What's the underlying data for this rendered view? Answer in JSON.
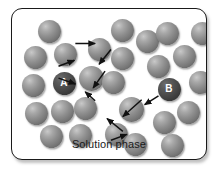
{
  "figure": {
    "caption": "Solution phase",
    "frame": {
      "border_color": "#1a1a1a",
      "background_color": "#ffffff",
      "corner_radius_px": 11
    },
    "particles": {
      "fill_color": "#8e8e8e",
      "highlight_color": "#c9c9c9",
      "labeled_fill_color": "#3a3a3a",
      "label_text_color": "#ffffff",
      "count": 28,
      "items": [
        {
          "id": "p1",
          "cx": 37,
          "cy": 22,
          "r": 11.5,
          "label": ""
        },
        {
          "id": "p2",
          "cx": 23,
          "cy": 48,
          "r": 11.5,
          "label": ""
        },
        {
          "id": "p3",
          "cx": 53,
          "cy": 45,
          "r": 11.5,
          "label": ""
        },
        {
          "id": "p4",
          "cx": 21,
          "cy": 76,
          "r": 11.5,
          "label": ""
        },
        {
          "id": "p5",
          "cx": 52,
          "cy": 74,
          "r": 11.5,
          "label": "A"
        },
        {
          "id": "p6",
          "cx": 24,
          "cy": 104,
          "r": 11.5,
          "label": ""
        },
        {
          "id": "p7",
          "cx": 50,
          "cy": 102,
          "r": 11.5,
          "label": ""
        },
        {
          "id": "p8",
          "cx": 39,
          "cy": 127,
          "r": 11.5,
          "label": ""
        },
        {
          "id": "p9",
          "cx": 68,
          "cy": 126,
          "r": 11.5,
          "label": ""
        },
        {
          "id": "p10",
          "cx": 73,
          "cy": 99,
          "r": 11.5,
          "label": ""
        },
        {
          "id": "p11",
          "cx": 79,
          "cy": 69,
          "r": 12.5,
          "label": ""
        },
        {
          "id": "p12",
          "cx": 87,
          "cy": 40,
          "r": 11.5,
          "label": ""
        },
        {
          "id": "p13",
          "cx": 104,
          "cy": 125,
          "r": 11.5,
          "label": ""
        },
        {
          "id": "p14",
          "cx": 101,
          "cy": 73,
          "r": 11.5,
          "label": ""
        },
        {
          "id": "p15",
          "cx": 110,
          "cy": 49,
          "r": 11.5,
          "label": ""
        },
        {
          "id": "p16",
          "cx": 123,
          "cy": 135,
          "r": 11.5,
          "label": ""
        },
        {
          "id": "p17",
          "cx": 119,
          "cy": 100,
          "r": 12.5,
          "label": ""
        },
        {
          "id": "p18",
          "cx": 135,
          "cy": 32,
          "r": 11.5,
          "label": ""
        },
        {
          "id": "p19",
          "cx": 146,
          "cy": 57,
          "r": 11.5,
          "label": ""
        },
        {
          "id": "p20",
          "cx": 152,
          "cy": 113,
          "r": 11.5,
          "label": ""
        },
        {
          "id": "p21",
          "cx": 160,
          "cy": 136,
          "r": 11.5,
          "label": ""
        },
        {
          "id": "p22",
          "cx": 157,
          "cy": 80,
          "r": 11.5,
          "label": "B"
        },
        {
          "id": "p23",
          "cx": 176,
          "cy": 103,
          "r": 11.5,
          "label": ""
        },
        {
          "id": "p24",
          "cx": 172,
          "cy": 47,
          "r": 11.5,
          "label": ""
        },
        {
          "id": "p25",
          "cx": 155,
          "cy": 24,
          "r": 11.5,
          "label": ""
        },
        {
          "id": "p26",
          "cx": 188,
          "cy": 73,
          "r": 11.5,
          "label": ""
        },
        {
          "id": "p27",
          "cx": 190,
          "cy": 24,
          "r": 11.5,
          "label": ""
        },
        {
          "id": "p28",
          "cx": 110,
          "cy": 21,
          "r": 11.5,
          "label": ""
        }
      ]
    },
    "arrows": {
      "color": "#111111",
      "description": "Diffusion hop path from particle A to particle B",
      "segments": [
        {
          "id": "a1",
          "x1": 47,
          "y1": 58,
          "x2": 63,
          "y2": 52
        },
        {
          "id": "a2",
          "x1": 47,
          "y1": 70,
          "x2": 64,
          "y2": 76
        },
        {
          "id": "a3",
          "x1": 64,
          "y1": 35,
          "x2": 84,
          "y2": 35
        },
        {
          "id": "a4",
          "x1": 100,
          "y1": 41,
          "x2": 88,
          "y2": 56
        },
        {
          "id": "a5",
          "x1": 94,
          "y1": 63,
          "x2": 82,
          "y2": 80
        },
        {
          "id": "a6",
          "x1": 84,
          "y1": 93,
          "x2": 74,
          "y2": 84
        },
        {
          "id": "a7",
          "x1": 148,
          "y1": 88,
          "x2": 134,
          "y2": 97
        },
        {
          "id": "a8",
          "x1": 131,
          "y1": 92,
          "x2": 112,
          "y2": 109
        },
        {
          "id": "a9",
          "x1": 112,
          "y1": 124,
          "x2": 96,
          "y2": 111
        },
        {
          "id": "a10",
          "x1": 100,
          "y1": 133,
          "x2": 116,
          "y2": 127
        }
      ]
    }
  }
}
